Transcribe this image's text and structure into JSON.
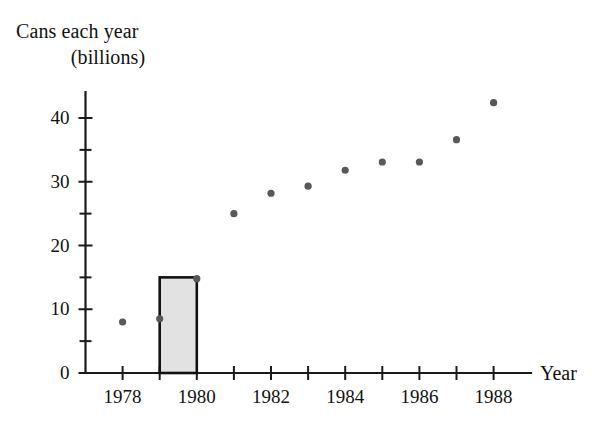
{
  "chart_data": {
    "type": "scatter",
    "title": "Cans each year (billions)",
    "title_lines": [
      "Cans each year",
      "(billions)"
    ],
    "xlabel": "Year",
    "ylabel": "Cans each year (billions)",
    "xlim": [
      1977,
      1989
    ],
    "ylim": [
      0,
      45
    ],
    "grid": false,
    "legend": null,
    "y_ticks_major": [
      0,
      10,
      20,
      30,
      40
    ],
    "y_ticks_minor": [
      5,
      15,
      25,
      35
    ],
    "y_tick_labels": [
      "0",
      "10",
      "20",
      "30",
      "40"
    ],
    "x_ticks": [
      1978,
      1979,
      1980,
      1981,
      1982,
      1983,
      1984,
      1985,
      1986,
      1987,
      1988
    ],
    "x_tick_labels_shown": [
      "1978",
      "1980",
      "1982",
      "1984",
      "1986",
      "1988"
    ],
    "x_labeled_years": [
      1978,
      1980,
      1982,
      1984,
      1986,
      1988
    ],
    "x": [
      1978,
      1979,
      1980,
      1981,
      1982,
      1983,
      1984,
      1985,
      1986,
      1987,
      1988
    ],
    "values": [
      8.0,
      8.5,
      14.8,
      25.0,
      28.2,
      29.3,
      31.8,
      33.1,
      33.1,
      36.6,
      42.4
    ],
    "point_color": "#585858",
    "axis_color": "#1a1a1a",
    "annotations": [
      {
        "type": "shaded-rectangle",
        "name": "highlight-bar-1979-1980",
        "x_start": 1979,
        "x_end": 1980,
        "y_bottom": 0,
        "y_top": 15.0,
        "fill": "#e2e2e2",
        "stroke": "#111111"
      }
    ]
  },
  "labels": {
    "title_line1": "Cans each year",
    "title_line2": "(billions)",
    "x_axis_name": "Year"
  }
}
